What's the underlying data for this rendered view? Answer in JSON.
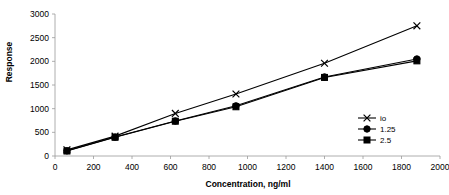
{
  "chart_data": {
    "type": "line",
    "title": "",
    "xlabel": "Concentration, ng/ml",
    "ylabel": "Response",
    "xlim": [
      0,
      2000
    ],
    "ylim": [
      0,
      3000
    ],
    "xticks": [
      0,
      200,
      400,
      600,
      800,
      1000,
      1200,
      1400,
      1600,
      1800,
      2000
    ],
    "yticks": [
      0,
      500,
      1000,
      1500,
      2000,
      2500,
      3000
    ],
    "grid": false,
    "legend_position": "right",
    "x": [
      62,
      312,
      625,
      940,
      1400,
      1880
    ],
    "series": [
      {
        "name": "io",
        "marker": "x",
        "values": [
          130,
          420,
          900,
          1310,
          1960,
          2750
        ]
      },
      {
        "name": "1.25",
        "marker": "circle",
        "values": [
          110,
          400,
          740,
          1060,
          1670,
          2050
        ]
      },
      {
        "name": "2.5",
        "marker": "square",
        "values": [
          105,
          395,
          735,
          1040,
          1660,
          2010
        ]
      }
    ]
  },
  "axis": {
    "y_title": "Response",
    "x_title": "Concentration, ng/ml",
    "y_tick_labels": [
      "0",
      "500",
      "1000",
      "1500",
      "2000",
      "2500",
      "3000"
    ],
    "x_tick_labels": [
      "0",
      "200",
      "400",
      "600",
      "800",
      "1000",
      "1200",
      "1400",
      "1600",
      "1800",
      "2000"
    ]
  },
  "legend": {
    "items": [
      {
        "label": "io",
        "marker": "x-marker"
      },
      {
        "label": "1.25",
        "marker": "circle-marker"
      },
      {
        "label": "2.5",
        "marker": "square-marker"
      }
    ]
  },
  "colors": {
    "series": "#000000",
    "axis": "#9a9a9a",
    "text": "#000000",
    "background": "#ffffff"
  }
}
